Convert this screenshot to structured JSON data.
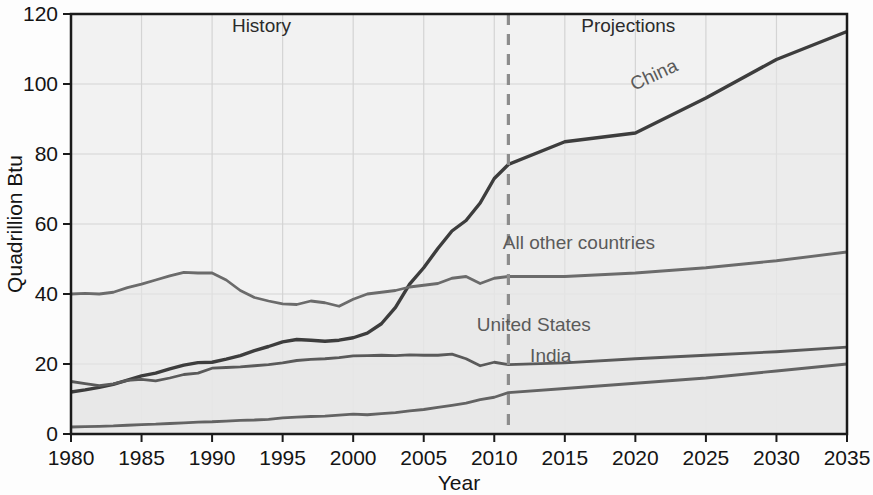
{
  "chart_data": {
    "type": "line",
    "title": "",
    "xlabel": "Year",
    "ylabel": "Quadrillion Btu",
    "xlim": [
      1980,
      2035
    ],
    "ylim": [
      0,
      120
    ],
    "xticks": [
      1980,
      1985,
      1990,
      1995,
      2000,
      2005,
      2010,
      2015,
      2020,
      2025,
      2030,
      2035
    ],
    "yticks": [
      0,
      20,
      40,
      60,
      80,
      100,
      120
    ],
    "grid": true,
    "legend_position": "inline-labels",
    "annotations": [
      {
        "name": "history-label",
        "text": "History",
        "x": 1993.5,
        "y": 115
      },
      {
        "name": "projections-label",
        "text": "Projections",
        "x": 2019.5,
        "y": 115
      },
      {
        "name": "divider",
        "text": "",
        "x": 2011,
        "style": "dashed-vertical"
      }
    ],
    "divider_year": 2011,
    "x": [
      1980,
      1981,
      1982,
      1983,
      1984,
      1985,
      1986,
      1987,
      1988,
      1989,
      1990,
      1991,
      1992,
      1993,
      1994,
      1995,
      1996,
      1997,
      1998,
      1999,
      2000,
      2001,
      2002,
      2003,
      2004,
      2005,
      2006,
      2007,
      2008,
      2009,
      2010,
      2011,
      2015,
      2020,
      2025,
      2030,
      2035
    ],
    "series": [
      {
        "name": "China",
        "label": "China",
        "color": "#3d3d3d",
        "values": [
          12.0,
          12.6,
          13.3,
          14.2,
          15.4,
          16.6,
          17.4,
          18.6,
          19.7,
          20.4,
          20.5,
          21.4,
          22.4,
          23.8,
          25.0,
          26.3,
          27.0,
          26.8,
          26.5,
          26.8,
          27.5,
          28.8,
          31.5,
          36.2,
          42.8,
          47.5,
          53.0,
          58.0,
          61.0,
          66.0,
          73.0,
          77.0,
          83.5,
          86.0,
          96.0,
          107.0,
          115.0
        ]
      },
      {
        "name": "All other countries",
        "label": "All other countries",
        "color": "#6b6b6b",
        "values": [
          40.0,
          40.2,
          40.0,
          40.5,
          41.8,
          42.8,
          44.0,
          45.2,
          46.2,
          46.0,
          46.0,
          44.0,
          41.0,
          39.0,
          38.0,
          37.2,
          37.0,
          38.0,
          37.5,
          36.5,
          38.5,
          40.0,
          40.5,
          41.0,
          42.0,
          42.5,
          43.0,
          44.5,
          45.0,
          43.0,
          44.5,
          45.0,
          45.0,
          46.0,
          47.5,
          49.5,
          52.0
        ]
      },
      {
        "name": "United States",
        "label": "United States",
        "color": "#5a5a5a",
        "values": [
          15.0,
          14.4,
          13.8,
          14.3,
          15.3,
          15.6,
          15.2,
          16.0,
          17.0,
          17.4,
          18.8,
          19.0,
          19.2,
          19.5,
          19.8,
          20.3,
          21.0,
          21.3,
          21.5,
          21.8,
          22.3,
          22.4,
          22.5,
          22.4,
          22.6,
          22.5,
          22.5,
          22.8,
          21.5,
          19.5,
          20.5,
          19.8,
          20.3,
          21.5,
          22.5,
          23.5,
          24.8
        ]
      },
      {
        "name": "India",
        "label": "India",
        "color": "#636363",
        "values": [
          2.0,
          2.1,
          2.2,
          2.3,
          2.5,
          2.7,
          2.8,
          3.0,
          3.2,
          3.4,
          3.5,
          3.7,
          3.9,
          4.0,
          4.2,
          4.6,
          4.8,
          5.0,
          5.1,
          5.4,
          5.7,
          5.5,
          5.8,
          6.1,
          6.6,
          7.0,
          7.6,
          8.2,
          8.8,
          9.8,
          10.5,
          11.8,
          13.0,
          14.5,
          16.0,
          18.0,
          20.0
        ]
      }
    ],
    "series_label_positions": [
      {
        "name": "China",
        "x": 2021.5,
        "y": 101,
        "rotate": -25
      },
      {
        "name": "All other countries",
        "x": 2016.0,
        "y": 53,
        "rotate": 0
      },
      {
        "name": "United States",
        "x": 2012.8,
        "y": 29.5,
        "rotate": 0
      },
      {
        "name": "India",
        "x": 2014.0,
        "y": 20.5,
        "rotate": 0
      }
    ]
  },
  "colors": {
    "plot_background": "#f2f2f2",
    "page_background": "#fdfdfd",
    "grid": "#d4d4d4",
    "axis": "#1a1a1a",
    "divider": "#8c8c8c",
    "area_fill": "#e8e8e8",
    "text": "#141414"
  }
}
